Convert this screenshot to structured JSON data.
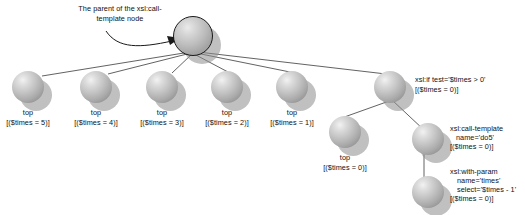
{
  "diagram": {
    "annotation": {
      "text": "The parent of the xsl:call-\ntemplate node"
    },
    "colors": {
      "background": "#ffffff",
      "node_fill": "#c3c3c3",
      "node_outline": "#1a1a1a",
      "edge": "#3a3a3a",
      "text": "#111111",
      "shadow": "#8c8c8c"
    },
    "nodes": [
      {
        "id": "root",
        "label": "",
        "x": 192,
        "y": 35,
        "r": 20,
        "outlined": true
      },
      {
        "id": "top5",
        "label": "top\n[($times = 5)]",
        "x": 28,
        "y": 88,
        "r": 17,
        "outlined": false
      },
      {
        "id": "top4",
        "label": "top\n[($times = 4)]",
        "x": 96,
        "y": 88,
        "r": 17,
        "outlined": false
      },
      {
        "id": "top3",
        "label": "top\n[($times = 3)]",
        "x": 162,
        "y": 88,
        "r": 17,
        "outlined": false
      },
      {
        "id": "top2",
        "label": "top\n[($times = 2)]",
        "x": 227,
        "y": 88,
        "r": 17,
        "outlined": false
      },
      {
        "id": "top1",
        "label": "top\n[($times = 1)]",
        "x": 292,
        "y": 88,
        "r": 17,
        "outlined": false
      },
      {
        "id": "top0",
        "label": "top\n[($times = 0)]",
        "x": 345,
        "y": 133,
        "r": 17,
        "outlined": false
      },
      {
        "id": "xslif",
        "label": "xsl:if test='$times > 0'\n[($times = 0)]",
        "x": 390,
        "y": 88,
        "r": 17,
        "outlined": false
      },
      {
        "id": "call",
        "label": "xsl:call-template\nname='do5'\n[($times = 0)]",
        "x": 428,
        "y": 140,
        "r": 17,
        "outlined": false
      },
      {
        "id": "param",
        "label": "xsl:with-param\nname='times'\nselect='$times - 1'\n[($times = 0)]",
        "x": 428,
        "y": 193,
        "r": 17,
        "outlined": false
      }
    ],
    "edges": [
      {
        "from": "root",
        "to": "top5"
      },
      {
        "from": "root",
        "to": "top4"
      },
      {
        "from": "root",
        "to": "top3"
      },
      {
        "from": "root",
        "to": "top2"
      },
      {
        "from": "root",
        "to": "top1"
      },
      {
        "from": "root",
        "to": "xslif"
      },
      {
        "from": "top0",
        "to": "xslif"
      },
      {
        "from": "xslif",
        "to": "call"
      },
      {
        "from": "call",
        "to": "param"
      }
    ],
    "labels": {
      "annotation": "The parent of the xsl:call-\ntemplate node",
      "top5_name": "top",
      "top5_pred": "[($times = 5)]",
      "top4_name": "top",
      "top4_pred": "[($times = 4)]",
      "top3_name": "top",
      "top3_pred": "[($times = 3)]",
      "top2_name": "top",
      "top2_pred": "[($times = 2)]",
      "top1_name": "top",
      "top1_pred": "[($times = 1)]",
      "top0_name": "top",
      "top0_pred": "[($times = 0)]",
      "xslif_line1": "xsl:if test='$times > 0'",
      "xslif_line2": "[($times = 0)]",
      "call_line1": "xsl:call-template",
      "call_line2": "name='do5'",
      "call_line3": "[($times = 0)]",
      "param_line1": "xsl:with-param",
      "param_line2": "name='times'",
      "param_line3": "select='$times - 1'",
      "param_line4": "[($times = 0)]"
    }
  }
}
